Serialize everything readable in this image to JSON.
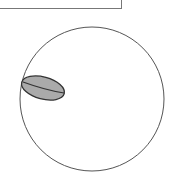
{
  "diagram": {
    "top_box": {
      "label": ""
    },
    "outer_circle": {
      "cx": 92,
      "cy": 99,
      "r": 72,
      "stroke": "#555555",
      "fill": "#ffffff"
    },
    "inner_ellipse": {
      "cx": 41,
      "cy": 88,
      "rx": 22,
      "ry": 11,
      "rotate": -12,
      "fill": "#aaaaaa",
      "stroke": "#333333"
    },
    "inner_line": {
      "x1": 22,
      "y1": 89,
      "x2": 63,
      "y2": 95,
      "stroke": "#333333"
    }
  }
}
